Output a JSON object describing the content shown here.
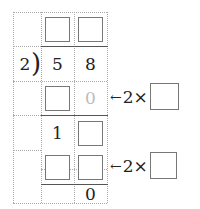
{
  "divisor": "2",
  "dividend": [
    "5",
    "8"
  ],
  "rows": {
    "quotient": [
      "",
      "[box]",
      "[box]"
    ],
    "dividend_row": [
      "2",
      "5",
      "8"
    ],
    "sub1": [
      "",
      "[box]",
      "0"
    ],
    "rem1": [
      "",
      "1",
      "[box]"
    ],
    "sub2": [
      "",
      "[box]",
      "[box]"
    ],
    "final": [
      "",
      "",
      "0"
    ]
  },
  "sub1_gray_digit": "0",
  "rem1_digit": "1",
  "final_digit": "0",
  "annotations": [
    {
      "arrow": "←",
      "text": "2×"
    },
    {
      "arrow": "←",
      "text": "2×"
    }
  ]
}
